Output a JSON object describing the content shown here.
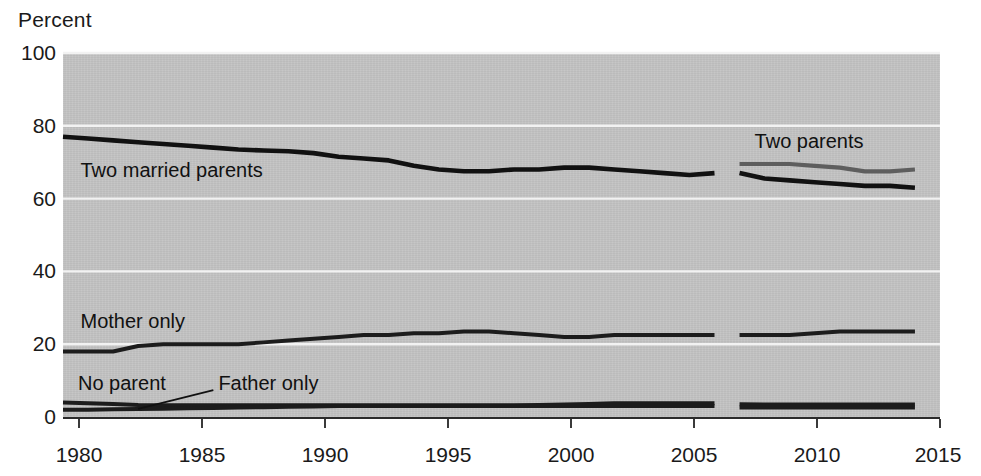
{
  "chart_data": {
    "type": "line",
    "title": "",
    "xlabel": "",
    "ylabel": "Percent",
    "ylim": [
      0,
      100
    ],
    "xlim": [
      1980,
      2015
    ],
    "yticks": [
      0,
      20,
      40,
      60,
      80,
      100
    ],
    "xticks": [
      1980,
      1985,
      1990,
      1995,
      2000,
      2005,
      2010,
      2015
    ],
    "grid": "horizontal-white-gridlines",
    "legend": "inline-annotations",
    "plot_background": "#c3c3c3",
    "series": [
      {
        "name": "Two married parents",
        "color": "#111111",
        "label_x": 1980.7,
        "label_y": 67,
        "x": [
          1980,
          1981,
          1982,
          1983,
          1984,
          1985,
          1986,
          1987,
          1988,
          1989,
          1990,
          1991,
          1992,
          1993,
          1994,
          1995,
          1996,
          1997,
          1998,
          1999,
          2000,
          2001,
          2002,
          2003,
          2004,
          2005,
          2006,
          2007,
          2008,
          2009,
          2010,
          2011,
          2012,
          2013,
          2014
        ],
        "values": [
          77,
          76.5,
          76,
          75.5,
          75,
          74.5,
          74,
          73.5,
          73.2,
          73,
          72.5,
          71.5,
          71,
          70.5,
          69,
          68,
          67.5,
          67.5,
          68,
          68,
          68.5,
          68.5,
          68,
          67.5,
          67,
          66.5,
          67,
          67,
          65.5,
          65,
          64.5,
          64,
          63.5,
          63.5,
          63
        ]
      },
      {
        "name": "Two parents",
        "color": "#5e5e5e",
        "label_x": 2007.6,
        "label_y": 75,
        "x": [
          2007,
          2008,
          2009,
          2010,
          2011,
          2012,
          2013,
          2014
        ],
        "values": [
          69.5,
          69.5,
          69.5,
          69,
          68.5,
          67.5,
          67.5,
          68
        ]
      },
      {
        "name": "Mother only",
        "color": "#1c1c1c",
        "label_x": 1980.7,
        "label_y": 25.5,
        "x": [
          1980,
          1981,
          1982,
          1983,
          1984,
          1985,
          1986,
          1987,
          1988,
          1989,
          1990,
          1991,
          1992,
          1993,
          1994,
          1995,
          1996,
          1997,
          1998,
          1999,
          2000,
          2001,
          2002,
          2003,
          2004,
          2005,
          2006,
          2007,
          2008,
          2009,
          2010,
          2011,
          2012,
          2013,
          2014
        ],
        "values": [
          18,
          18,
          18,
          19.5,
          20,
          20,
          20,
          20,
          20.5,
          21,
          21.5,
          22,
          22.5,
          22.5,
          23,
          23,
          23.5,
          23.5,
          23,
          22.5,
          22,
          22,
          22.5,
          22.5,
          22.5,
          22.5,
          22.5,
          22.5,
          22.5,
          22.5,
          23,
          23.5,
          23.5,
          23.5,
          23.5
        ]
      },
      {
        "name": "No parent",
        "color": "#1c1c1c",
        "label_x": 1980.6,
        "label_y": 8.5,
        "x": [
          1980,
          1981,
          1982,
          1983,
          1984,
          1985,
          1986,
          1987,
          1988,
          1989,
          1990,
          1991,
          1992,
          1993,
          1994,
          1995,
          1996,
          1997,
          1998,
          1999,
          2000,
          2001,
          2002,
          2003,
          2004,
          2005,
          2006,
          2007,
          2008,
          2009,
          2010,
          2011,
          2012,
          2013,
          2014
        ],
        "values": [
          4,
          3.8,
          3.6,
          3.3,
          3.2,
          3.2,
          3.2,
          3.2,
          3.2,
          3.2,
          3.2,
          3.2,
          3.2,
          3.2,
          3.2,
          3.2,
          3.2,
          3.2,
          3.2,
          3.3,
          3.4,
          3.6,
          3.8,
          3.8,
          3.8,
          3.8,
          3.8,
          3.5,
          3.4,
          3.4,
          3.4,
          3.4,
          3.4,
          3.4,
          3.4
        ]
      },
      {
        "name": "Father only",
        "color": "#1c1c1c",
        "label_x": 1986.2,
        "label_y": 8.5,
        "x": [
          1980,
          1981,
          1982,
          1983,
          1984,
          1985,
          1986,
          1987,
          1988,
          1989,
          1990,
          1991,
          1992,
          1993,
          1994,
          1995,
          1996,
          1997,
          1998,
          1999,
          2000,
          2001,
          2002,
          2003,
          2004,
          2005,
          2006,
          2007,
          2008,
          2009,
          2010,
          2011,
          2012,
          2013,
          2014
        ],
        "values": [
          2,
          2,
          2.1,
          2.2,
          2.3,
          2.4,
          2.5,
          2.6,
          2.7,
          2.8,
          2.9,
          3,
          3,
          3,
          3,
          3,
          3,
          3,
          3,
          3,
          3,
          3,
          3,
          3,
          3,
          3,
          3,
          2.6,
          2.6,
          2.6,
          2.6,
          2.6,
          2.6,
          2.6,
          2.6
        ]
      }
    ],
    "annotations": [
      {
        "name": "father-only-leader",
        "from_x": 1986.0,
        "from_y": 7.4,
        "to_x": 1983.0,
        "to_y": 2.2
      }
    ],
    "series_break": {
      "note": "data break between 2006 and 2007",
      "gap_start_year": 2006.15,
      "gap_end_year": 2006.95
    }
  },
  "labels": {
    "y_axis_title": "Percent",
    "two_married_parents": "Two married parents",
    "two_parents": "Two parents",
    "mother_only": "Mother only",
    "no_parent": "No parent",
    "father_only": "Father only"
  },
  "yticks": {
    "t0": "0",
    "t20": "20",
    "t40": "40",
    "t60": "60",
    "t80": "80",
    "t100": "100"
  },
  "xticks": {
    "t1980": "1980",
    "t1985": "1985",
    "t1990": "1990",
    "t1995": "1995",
    "t2000": "2000",
    "t2005": "2005",
    "t2010": "2010",
    "t2015": "2015"
  },
  "colors": {
    "plot_background": "#c3c3c3",
    "gridline": "#f2f2f2",
    "primary_line": "#111111",
    "secondary_line": "#5e5e5e",
    "axis": "#2b2b2b"
  }
}
